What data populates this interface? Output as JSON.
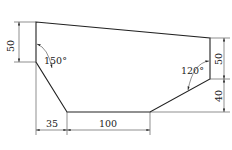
{
  "drawing": {
    "type": "technical-dimension-drawing",
    "outline_vertices": [
      [
        36,
        22
      ],
      [
        210,
        38
      ],
      [
        210,
        79
      ],
      [
        150,
        112
      ],
      [
        67,
        112
      ],
      [
        36,
        62
      ]
    ],
    "dimensions": {
      "left_vertical": "50",
      "right_upper_vertical": "50",
      "right_lower_vertical": "40",
      "bottom_left_horizontal": "35",
      "bottom_horizontal": "100"
    },
    "angles": {
      "left": "150°",
      "right": "120°"
    },
    "colors": {
      "line": "#222222",
      "background": "#ffffff"
    }
  }
}
